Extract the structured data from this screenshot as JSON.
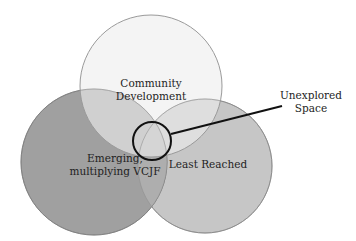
{
  "diagram": {
    "type": "venn",
    "sets": [
      {
        "id": "community",
        "label_line1": "Community",
        "label_line2": "Development",
        "fill": "#ececec",
        "stroke": "#9a9a9a"
      },
      {
        "id": "emerging",
        "label_line1": "Emerging,",
        "label_line2": "multiplying VCJF",
        "fill": "#9e9e9e",
        "stroke": "#7a7a7a"
      },
      {
        "id": "least",
        "label_line1": "Least Reached",
        "fill": "#c4c4c4",
        "stroke": "#8e8e8e"
      }
    ],
    "callout": {
      "label_line1": "Unexplored",
      "label_line2": "Space",
      "stroke": "#111111"
    }
  }
}
